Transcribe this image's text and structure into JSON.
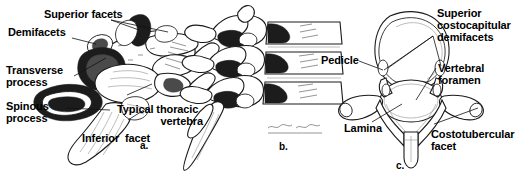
{
  "figure": {
    "background_color": "#ffffff",
    "ink_color": "#000000"
  },
  "panels": [
    {
      "letter": "a.",
      "view": "oblique view of a typical thoracic vertebra",
      "labels": [
        {
          "id": "superior-facets",
          "text": "Superior facets"
        },
        {
          "id": "demifacets",
          "text": "Demifacets"
        },
        {
          "id": "transverse-process",
          "text": "Transverse\nprocess"
        },
        {
          "id": "spinous-process",
          "text": "Spinous\nprocess"
        },
        {
          "id": "inferior-facet",
          "text": "Inferior  facet"
        },
        {
          "id": "typical-thoracic-vertebra",
          "text": "Typical thoracic\nvertebra"
        }
      ]
    },
    {
      "letter": "b.",
      "view": "lateral view of three articulated thoracic vertebrae",
      "labels": []
    },
    {
      "letter": "c.",
      "view": "superior view of a thoracic vertebra",
      "labels": [
        {
          "id": "pedicle",
          "text": "Pedicle"
        },
        {
          "id": "lamina",
          "text": "Lamina"
        },
        {
          "id": "superior-costocapitular-demifacets",
          "text": "Superior\ncostocapitular\ndemifacets"
        },
        {
          "id": "vertebral-foramen",
          "text": "Vertebral\nforamen"
        },
        {
          "id": "costotubercular-facet",
          "text": "Costotubercular\nfacet"
        }
      ]
    }
  ],
  "labels_flat": {
    "superior_facets": "Superior facets",
    "demifacets": "Demifacets",
    "transverse_process_l1": "Transverse",
    "transverse_process_l2": "process",
    "spinous_process_l1": "Spinous",
    "spinous_process_l2": "process",
    "inferior_facet": "Inferior  facet",
    "typical_thoracic_l1": "Typical thoracic",
    "typical_thoracic_l2": "vertebra",
    "pedicle": "Pedicle",
    "lamina": "Lamina",
    "superior_costo_l1": "Superior",
    "superior_costo_l2": "costocapitular",
    "superior_costo_l3": "demifacets",
    "vertebral_foramen_l1": "Vertebral",
    "vertebral_foramen_l2": "foramen",
    "costotubercular_l1": "Costotubercular",
    "costotubercular_l2": "facet",
    "letter_a": "a.",
    "letter_b": "b.",
    "letter_c": "c."
  }
}
